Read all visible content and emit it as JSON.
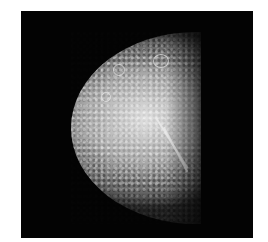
{
  "image": {
    "subject": "cratered moon, half-lit",
    "background_color": "#ffffff",
    "frame_color": "#030303",
    "surface_highlight": "#e6e6e6",
    "surface_shadow": "#1a1a1a"
  }
}
